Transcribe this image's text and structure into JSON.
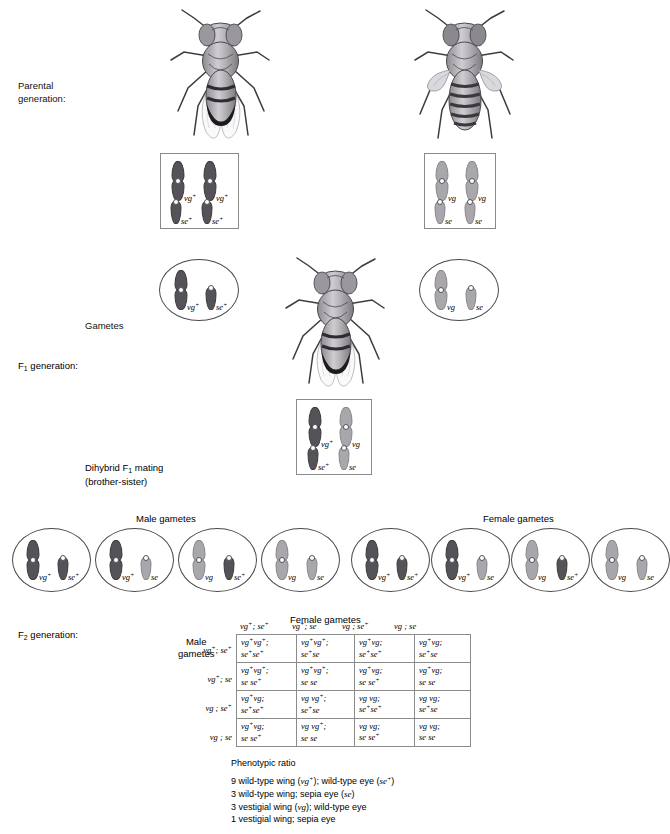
{
  "diagram": {
    "title_labels": {
      "parental": "Parental\ngeneration:",
      "gametes": "Gametes",
      "f1": "F₁ generation:",
      "dihybrid": "Dihybrid F₁ mating\n(brother-sister)",
      "f2": "F₂ generation:",
      "male_gametes": "Male gametes",
      "female_gametes": "Female gametes",
      "male_gametes_side": "Male\ngametes",
      "female_gametes_top": "Female gametes"
    },
    "parents": [
      {
        "name": "wild-type-parent",
        "phenotype": "wild type",
        "alleles": [
          {
            "gene": "vg",
            "label": "vg",
            "sup": "+",
            "type": "long",
            "shade": "dark"
          },
          {
            "gene": "vg",
            "label": "vg",
            "sup": "+",
            "type": "long",
            "shade": "dark"
          },
          {
            "gene": "se",
            "label": "se",
            "sup": "+",
            "type": "short",
            "shade": "dark"
          },
          {
            "gene": "se",
            "label": "se",
            "sup": "+",
            "type": "short",
            "shade": "dark"
          }
        ]
      },
      {
        "name": "vestigial-sepia-parent",
        "phenotype": "vestigial wing, sepia eye",
        "alleles": [
          {
            "gene": "vg",
            "label": "vg",
            "sup": "",
            "type": "long",
            "shade": "light"
          },
          {
            "gene": "vg",
            "label": "vg",
            "sup": "",
            "type": "long",
            "shade": "light"
          },
          {
            "gene": "se",
            "label": "se",
            "sup": "",
            "type": "short",
            "shade": "light"
          },
          {
            "gene": "se",
            "label": "se",
            "sup": "",
            "type": "short",
            "shade": "light"
          }
        ]
      }
    ],
    "parent_gametes": [
      {
        "name": "parental-gamete-left",
        "alleles": [
          {
            "label": "vg",
            "sup": "+",
            "type": "long",
            "shade": "dark"
          },
          {
            "label": "se",
            "sup": "+",
            "type": "short",
            "shade": "dark"
          }
        ]
      },
      {
        "name": "parental-gamete-right",
        "alleles": [
          {
            "label": "vg",
            "sup": "",
            "type": "long",
            "shade": "light"
          },
          {
            "label": "se",
            "sup": "",
            "type": "short",
            "shade": "light"
          }
        ]
      }
    ],
    "f1_genotype": {
      "name": "f1-genotype-box",
      "alleles": [
        {
          "label": "vg",
          "sup": "+",
          "type": "long",
          "shade": "dark"
        },
        {
          "label": "vg",
          "sup": "",
          "type": "long",
          "shade": "light"
        },
        {
          "label": "se",
          "sup": "+",
          "type": "short",
          "shade": "dark"
        },
        {
          "label": "se",
          "sup": "",
          "type": "short",
          "shade": "light"
        }
      ]
    },
    "male_gametes": [
      {
        "alleles": [
          {
            "label": "vg",
            "sup": "+",
            "type": "long",
            "shade": "dark"
          },
          {
            "label": "se",
            "sup": "+",
            "type": "short",
            "shade": "dark"
          }
        ]
      },
      {
        "alleles": [
          {
            "label": "vg",
            "sup": "+",
            "type": "long",
            "shade": "dark"
          },
          {
            "label": "se",
            "sup": "",
            "type": "short",
            "shade": "light"
          }
        ]
      },
      {
        "alleles": [
          {
            "label": "vg",
            "sup": "",
            "type": "long",
            "shade": "light"
          },
          {
            "label": "se",
            "sup": "+",
            "type": "short",
            "shade": "dark"
          }
        ]
      },
      {
        "alleles": [
          {
            "label": "vg",
            "sup": "",
            "type": "long",
            "shade": "light"
          },
          {
            "label": "se",
            "sup": "",
            "type": "short",
            "shade": "light"
          }
        ]
      }
    ],
    "female_gametes": [
      {
        "alleles": [
          {
            "label": "vg",
            "sup": "+",
            "type": "long",
            "shade": "dark"
          },
          {
            "label": "se",
            "sup": "+",
            "type": "short",
            "shade": "dark"
          }
        ]
      },
      {
        "alleles": [
          {
            "label": "vg",
            "sup": "+",
            "type": "long",
            "shade": "dark"
          },
          {
            "label": "se",
            "sup": "",
            "type": "short",
            "shade": "light"
          }
        ]
      },
      {
        "alleles": [
          {
            "label": "vg",
            "sup": "",
            "type": "long",
            "shade": "light"
          },
          {
            "label": "se",
            "sup": "+",
            "type": "short",
            "shade": "dark"
          }
        ]
      },
      {
        "alleles": [
          {
            "label": "vg",
            "sup": "",
            "type": "long",
            "shade": "light"
          },
          {
            "label": "se",
            "sup": "",
            "type": "short",
            "shade": "light"
          }
        ]
      }
    ],
    "punnett": {
      "column_headers": [
        "vg<sup>+</sup>; se<sup>+</sup>",
        "vg<sup>+</sup>; se",
        "vg ; se<sup>+</sup>",
        "vg ; se"
      ],
      "row_headers": [
        "vg<sup>+</sup>; se<sup>+</sup>",
        "vg<sup>+</sup>; se",
        "vg ; se<sup>+</sup>",
        "vg ; se"
      ],
      "cells": [
        [
          "vg<sup>+</sup>vg<sup>+</sup>;\nse<sup>+</sup>se<sup>+</sup>",
          "vg<sup>+</sup>vg<sup>+</sup>;\nse<sup>+</sup>se",
          "vg<sup>+</sup>vg;\nse<sup>+</sup>se<sup>+</sup>",
          "vg<sup>+</sup>vg;\nse<sup>+</sup>se"
        ],
        [
          "vg<sup>+</sup>vg<sup>+</sup>;\nse se<sup>+</sup>",
          "vg<sup>+</sup>vg<sup>+</sup>;\nse se",
          "vg<sup>+</sup>vg;\nse se<sup>+</sup>",
          "vg<sup>+</sup>vg;\nse se"
        ],
        [
          "vg<sup>+</sup>vg;\nse<sup>+</sup>se<sup>+</sup>",
          "vg vg<sup>+</sup>;\nse<sup>+</sup>se",
          "vg vg;\nse<sup>+</sup>se<sup>+</sup>",
          "vg vg;\nse<sup>+</sup>se"
        ],
        [
          "vg<sup>+</sup>vg;\nse se<sup>+</sup>",
          "vg vg<sup>+</sup>;\nse se",
          "vg vg;\nse se<sup>+</sup>",
          "vg vg;\nse se"
        ]
      ]
    },
    "phenotypic_ratio": {
      "heading": "Phenotypic ratio",
      "lines": [
        "9 wild-type wing (<i>vg<sup>+</sup></i>); wild-type eye (<i>se<sup>+</sup></i>)",
        "3 wild-type wing; sepia eye (<i>se</i>)",
        "3 vestigial wing (<i>vg</i>); wild-type eye",
        "1 vestigial wing; sepia eye"
      ]
    },
    "colors": {
      "dominant_chromosome": "#565358",
      "recessive_chromosome": "#a9a7ab",
      "box_border": "#8a8a8a",
      "circle_border": "#4a4a4a",
      "text": "#111111"
    }
  }
}
